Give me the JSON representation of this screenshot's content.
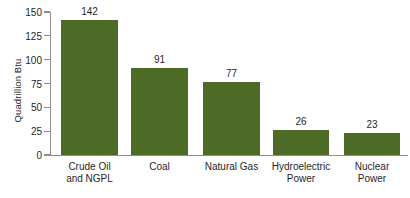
{
  "chart_data": {
    "type": "bar",
    "title": "",
    "subtitle": "",
    "xlabel": "",
    "ylabel": "Quadrillion Btu",
    "categories": [
      "Crude Oil and NGPL",
      "Coal",
      "Natural Gas",
      "Hydroelectric Power",
      "Nuclear Power"
    ],
    "category_lines": [
      [
        "Crude Oil",
        "and NGPL"
      ],
      [
        "Coal"
      ],
      [
        "Natural Gas"
      ],
      [
        "Hydroelectric",
        "Power"
      ],
      [
        "Nuclear",
        "Power"
      ]
    ],
    "values": [
      142,
      91,
      77,
      26,
      23
    ],
    "value_labels": [
      "142",
      "91",
      "77",
      "26",
      "23"
    ],
    "ylim": [
      0,
      150
    ],
    "yticks": [
      0,
      25,
      50,
      75,
      100,
      125,
      150
    ],
    "ytick_labels": [
      "0",
      "25",
      "50",
      "75",
      "100",
      "125",
      "150"
    ],
    "grid": false,
    "legend": false,
    "bar_color": "#4d6b27",
    "axis_color": "#8d8d8d",
    "text_color": "#1f1f1f",
    "background_color": "#ffffff"
  }
}
